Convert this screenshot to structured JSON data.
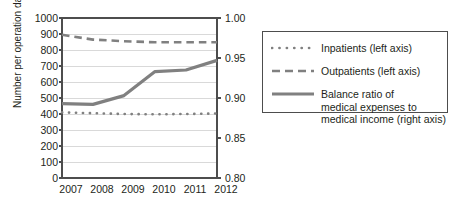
{
  "chart_data": {
    "type": "line",
    "title": "",
    "xlabel": "",
    "ylabel": "Number per operation day",
    "y2label": "",
    "categories": [
      "2007",
      "2008",
      "2009",
      "2010",
      "2011",
      "2012"
    ],
    "x": [
      2007,
      2008,
      2009,
      2010,
      2011,
      2012
    ],
    "ylim": [
      0,
      1000
    ],
    "y2lim": [
      0.8,
      1.0
    ],
    "yticks": [
      0,
      100,
      200,
      300,
      400,
      500,
      600,
      700,
      800,
      900,
      1000
    ],
    "ytick_labels": [
      "0",
      "100",
      "200",
      "300",
      "400",
      "500",
      "600",
      "700",
      "800",
      "900",
      "1000"
    ],
    "y2ticks": [
      0.8,
      0.85,
      0.9,
      0.95,
      1.0
    ],
    "y2tick_labels": [
      "0.80",
      "0.85",
      "0.90",
      "0.95",
      "1.00"
    ],
    "grid": true,
    "grid_axis": "y",
    "legend_position": "right-outside",
    "series": [
      {
        "name": "Inpatients (left axis)",
        "axis": "left",
        "style": "dotted",
        "color": "#808080",
        "values": [
          410,
          405,
          400,
          398,
          400,
          403
        ]
      },
      {
        "name": "Outpatients (left axis)",
        "axis": "left",
        "style": "dashed",
        "color": "#808080",
        "values": [
          895,
          865,
          855,
          848,
          848,
          848
        ]
      },
      {
        "name": "Balance ratio of\nmedical expenses to\nmedical income (right axis)",
        "axis": "right",
        "style": "solid",
        "color": "#808080",
        "values": [
          0.893,
          0.892,
          0.903,
          0.933,
          0.935,
          0.947
        ]
      }
    ]
  },
  "axes": {
    "y_axis_title": "Number per operation day",
    "y_left_labels": [
      "1000",
      "900",
      "800",
      "700",
      "600",
      "500",
      "400",
      "300",
      "200",
      "100",
      "0"
    ],
    "y_right_labels": [
      "1.00",
      "0.95",
      "0.90",
      "0.85",
      "0.80"
    ],
    "x_labels": [
      "2007",
      "2008",
      "2009",
      "2010",
      "2011",
      "2012"
    ]
  },
  "legend": {
    "entries": [
      {
        "key": "dotted-line-swatch",
        "label": "Inpatients (left axis)"
      },
      {
        "key": "dashed-line-swatch",
        "label": "Outpatients (left axis)"
      },
      {
        "key": "solid-line-swatch",
        "label": "Balance ratio of\nmedical expenses to\nmedical income (right axis)"
      }
    ]
  },
  "colors": {
    "series_line": "#808080",
    "axis": "#4d4d4d",
    "grid": "#d9d9d9",
    "text": "#231f20",
    "background": "#ffffff"
  }
}
